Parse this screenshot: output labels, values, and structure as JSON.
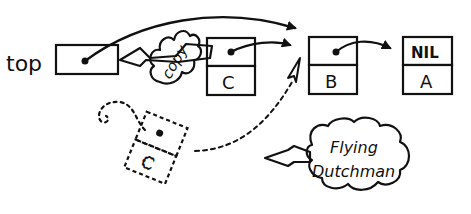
{
  "diagram": {
    "title": "",
    "colors": {
      "ink": "#111111",
      "background": "#ffffff"
    },
    "top_pointer": {
      "label": "top"
    },
    "nodes": [
      {
        "id": "node-c",
        "value": "C",
        "next": "node-b"
      },
      {
        "id": "node-b",
        "value": "B",
        "next": "node-a"
      },
      {
        "id": "node-a",
        "value": "A",
        "next_label": "NIL"
      }
    ],
    "ghost_node": {
      "id": "node-c-ghost",
      "value": "C",
      "style": "dashed",
      "next": "node-b"
    },
    "annotations": {
      "copy": "copy",
      "flying_dutchman_line1": "Flying",
      "flying_dutchman_line2": "Dutchman"
    },
    "edges": [
      {
        "from": "top",
        "to": "node-b",
        "style": "solid-arc"
      },
      {
        "from": "node-c",
        "to": "node-b",
        "style": "solid"
      },
      {
        "from": "node-b",
        "to": "node-a",
        "style": "solid"
      },
      {
        "from": "node-c-ghost",
        "to": "node-b",
        "style": "dotted"
      },
      {
        "from": "node-c",
        "to": "top",
        "style": "copy-arrow"
      }
    ]
  }
}
